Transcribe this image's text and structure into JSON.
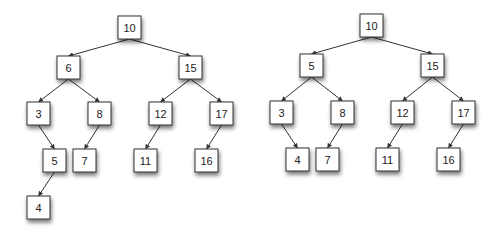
{
  "diagram": {
    "type": "binary-search-tree-comparison",
    "node_size": 23,
    "colors": {
      "background": "#ffffff",
      "node_fill": "#ffffff",
      "node_border": "#333333",
      "edge": "#333333",
      "text": "#222222",
      "shadow": "#555555"
    },
    "trees": [
      {
        "name": "tree-left",
        "nodes": [
          {
            "id": "L10",
            "label": "10",
            "x": 118,
            "y": 16
          },
          {
            "id": "L6",
            "label": "6",
            "x": 57,
            "y": 56
          },
          {
            "id": "L15",
            "label": "15",
            "x": 179,
            "y": 56
          },
          {
            "id": "L3",
            "label": "3",
            "x": 27,
            "y": 102
          },
          {
            "id": "L8",
            "label": "8",
            "x": 88,
            "y": 102
          },
          {
            "id": "L12",
            "label": "12",
            "x": 149,
            "y": 102
          },
          {
            "id": "L17",
            "label": "17",
            "x": 210,
            "y": 102
          },
          {
            "id": "L5",
            "label": "5",
            "x": 43,
            "y": 149
          },
          {
            "id": "L7",
            "label": "7",
            "x": 73,
            "y": 149
          },
          {
            "id": "L11",
            "label": "11",
            "x": 134,
            "y": 149
          },
          {
            "id": "L16",
            "label": "16",
            "x": 195,
            "y": 149
          },
          {
            "id": "L4",
            "label": "4",
            "x": 27,
            "y": 196
          }
        ],
        "edges": [
          [
            "L10",
            "L6"
          ],
          [
            "L10",
            "L15"
          ],
          [
            "L6",
            "L3"
          ],
          [
            "L6",
            "L8"
          ],
          [
            "L15",
            "L12"
          ],
          [
            "L15",
            "L17"
          ],
          [
            "L3",
            "L5"
          ],
          [
            "L8",
            "L7"
          ],
          [
            "L12",
            "L11"
          ],
          [
            "L17",
            "L16"
          ],
          [
            "L5",
            "L4"
          ]
        ]
      },
      {
        "name": "tree-right",
        "nodes": [
          {
            "id": "R10",
            "label": "10",
            "x": 360,
            "y": 14
          },
          {
            "id": "R5",
            "label": "5",
            "x": 300,
            "y": 54
          },
          {
            "id": "R15",
            "label": "15",
            "x": 421,
            "y": 54
          },
          {
            "id": "R3",
            "label": "3",
            "x": 270,
            "y": 101
          },
          {
            "id": "R8",
            "label": "8",
            "x": 331,
            "y": 101
          },
          {
            "id": "R12",
            "label": "12",
            "x": 391,
            "y": 101
          },
          {
            "id": "R17",
            "label": "17",
            "x": 452,
            "y": 101
          },
          {
            "id": "R4",
            "label": "4",
            "x": 286,
            "y": 148
          },
          {
            "id": "R7",
            "label": "7",
            "x": 316,
            "y": 148
          },
          {
            "id": "R11",
            "label": "11",
            "x": 376,
            "y": 148
          },
          {
            "id": "R16",
            "label": "16",
            "x": 437,
            "y": 148
          }
        ],
        "edges": [
          [
            "R10",
            "R5"
          ],
          [
            "R10",
            "R15"
          ],
          [
            "R5",
            "R3"
          ],
          [
            "R5",
            "R8"
          ],
          [
            "R15",
            "R12"
          ],
          [
            "R15",
            "R17"
          ],
          [
            "R3",
            "R4"
          ],
          [
            "R8",
            "R7"
          ],
          [
            "R12",
            "R11"
          ],
          [
            "R17",
            "R16"
          ]
        ]
      }
    ]
  }
}
